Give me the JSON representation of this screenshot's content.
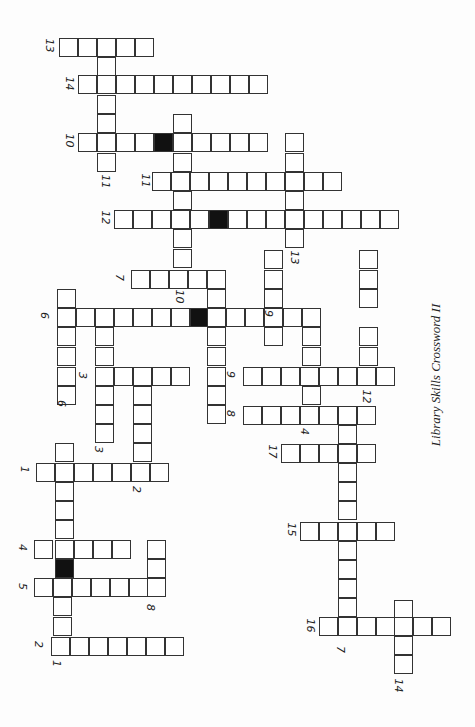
{
  "title": "Library Skills Crossword II",
  "cell_size": 19,
  "cells": [
    [
      59,
      38
    ],
    [
      78,
      38
    ],
    [
      97,
      38
    ],
    [
      116,
      38
    ],
    [
      135,
      38
    ],
    [
      97,
      57
    ],
    [
      78,
      75
    ],
    [
      97,
      75
    ],
    [
      116,
      75
    ],
    [
      135,
      75
    ],
    [
      154,
      75
    ],
    [
      173,
      75
    ],
    [
      192,
      75
    ],
    [
      211,
      75
    ],
    [
      230,
      75
    ],
    [
      249,
      75
    ],
    [
      97,
      95
    ],
    [
      97,
      114
    ],
    [
      173,
      114
    ],
    [
      78,
      133
    ],
    [
      97,
      133
    ],
    [
      116,
      133
    ],
    [
      135,
      133
    ],
    [
      154,
      133,
      "black"
    ],
    [
      173,
      133
    ],
    [
      192,
      133
    ],
    [
      211,
      133
    ],
    [
      230,
      133
    ],
    [
      249,
      133
    ],
    [
      285,
      133
    ],
    [
      285,
      153
    ],
    [
      97,
      153
    ],
    [
      173,
      153
    ],
    [
      152,
      172
    ],
    [
      171,
      172
    ],
    [
      190,
      172
    ],
    [
      209,
      172
    ],
    [
      228,
      172
    ],
    [
      247,
      172
    ],
    [
      266,
      172
    ],
    [
      285,
      172
    ],
    [
      304,
      172
    ],
    [
      323,
      172
    ],
    [
      173,
      191
    ],
    [
      285,
      191
    ],
    [
      114,
      210
    ],
    [
      133,
      210
    ],
    [
      152,
      210
    ],
    [
      171,
      210
    ],
    [
      190,
      210
    ],
    [
      209,
      210,
      "black"
    ],
    [
      228,
      210
    ],
    [
      247,
      210
    ],
    [
      266,
      210
    ],
    [
      285,
      210
    ],
    [
      304,
      210
    ],
    [
      323,
      210
    ],
    [
      342,
      210
    ],
    [
      361,
      210
    ],
    [
      380,
      210
    ],
    [
      173,
      229
    ],
    [
      285,
      229
    ],
    [
      173,
      249
    ],
    [
      264,
      250
    ],
    [
      359,
      250
    ],
    [
      131,
      270
    ],
    [
      150,
      270
    ],
    [
      169,
      270
    ],
    [
      188,
      270
    ],
    [
      207,
      270
    ],
    [
      264,
      270
    ],
    [
      359,
      270
    ],
    [
      57,
      289
    ],
    [
      207,
      289
    ],
    [
      264,
      289
    ],
    [
      359,
      289
    ],
    [
      57,
      308
    ],
    [
      76,
      308
    ],
    [
      95,
      308
    ],
    [
      114,
      308
    ],
    [
      133,
      308
    ],
    [
      152,
      308
    ],
    [
      171,
      308
    ],
    [
      190,
      308,
      "black"
    ],
    [
      207,
      308
    ],
    [
      226,
      308
    ],
    [
      245,
      308
    ],
    [
      264,
      308
    ],
    [
      283,
      308
    ],
    [
      302,
      308
    ],
    [
      57,
      327
    ],
    [
      95,
      327
    ],
    [
      207,
      327
    ],
    [
      264,
      327
    ],
    [
      302,
      327
    ],
    [
      359,
      327
    ],
    [
      57,
      347
    ],
    [
      95,
      347
    ],
    [
      207,
      347
    ],
    [
      302,
      347
    ],
    [
      359,
      347
    ],
    [
      57,
      367
    ],
    [
      95,
      367
    ],
    [
      114,
      367
    ],
    [
      133,
      367
    ],
    [
      152,
      367
    ],
    [
      171,
      367
    ],
    [
      207,
      367
    ],
    [
      243,
      367
    ],
    [
      262,
      367
    ],
    [
      281,
      367
    ],
    [
      300,
      367
    ],
    [
      319,
      367
    ],
    [
      338,
      367
    ],
    [
      357,
      367
    ],
    [
      376,
      367
    ],
    [
      57,
      386
    ],
    [
      95,
      386
    ],
    [
      133,
      386
    ],
    [
      207,
      386
    ],
    [
      302,
      386
    ],
    [
      95,
      405
    ],
    [
      133,
      405
    ],
    [
      207,
      405
    ],
    [
      243,
      406
    ],
    [
      262,
      406
    ],
    [
      281,
      406
    ],
    [
      300,
      406
    ],
    [
      319,
      406
    ],
    [
      338,
      406
    ],
    [
      357,
      406
    ],
    [
      95,
      424
    ],
    [
      133,
      424
    ],
    [
      338,
      425
    ],
    [
      55,
      443
    ],
    [
      133,
      443
    ],
    [
      281,
      444
    ],
    [
      300,
      444
    ],
    [
      319,
      444
    ],
    [
      338,
      444
    ],
    [
      357,
      444
    ],
    [
      36,
      463
    ],
    [
      55,
      463
    ],
    [
      74,
      463
    ],
    [
      93,
      463
    ],
    [
      112,
      463
    ],
    [
      131,
      463
    ],
    [
      150,
      463
    ],
    [
      338,
      463
    ],
    [
      55,
      482
    ],
    [
      338,
      482
    ],
    [
      55,
      501
    ],
    [
      338,
      501
    ],
    [
      55,
      520
    ],
    [
      300,
      522
    ],
    [
      319,
      522
    ],
    [
      338,
      522
    ],
    [
      357,
      522
    ],
    [
      376,
      522
    ],
    [
      34,
      540
    ],
    [
      55,
      540
    ],
    [
      74,
      540
    ],
    [
      93,
      540
    ],
    [
      112,
      540
    ],
    [
      147,
      540
    ],
    [
      338,
      541
    ],
    [
      55,
      559,
      "black"
    ],
    [
      147,
      559
    ],
    [
      338,
      560
    ],
    [
      34,
      578
    ],
    [
      53,
      578
    ],
    [
      72,
      578
    ],
    [
      91,
      578
    ],
    [
      110,
      578
    ],
    [
      129,
      578
    ],
    [
      147,
      578
    ],
    [
      338,
      579
    ],
    [
      53,
      597
    ],
    [
      338,
      598
    ],
    [
      394,
      600
    ],
    [
      53,
      617
    ],
    [
      319,
      617
    ],
    [
      338,
      617
    ],
    [
      357,
      617
    ],
    [
      376,
      617
    ],
    [
      394,
      617
    ],
    [
      413,
      617
    ],
    [
      432,
      617
    ],
    [
      51,
      637
    ],
    [
      70,
      637
    ],
    [
      89,
      637
    ],
    [
      108,
      637
    ],
    [
      127,
      637
    ],
    [
      146,
      637
    ],
    [
      165,
      637
    ],
    [
      394,
      636
    ],
    [
      394,
      655
    ]
  ],
  "numbers": [
    {
      "n": "13",
      "x": 48,
      "y": 46
    },
    {
      "n": "14",
      "x": 68,
      "y": 84
    },
    {
      "n": "10",
      "x": 68,
      "y": 141
    },
    {
      "n": "11",
      "x": 104,
      "y": 182
    },
    {
      "n": "11",
      "x": 144,
      "y": 181
    },
    {
      "n": "12",
      "x": 104,
      "y": 218
    },
    {
      "n": "13",
      "x": 293,
      "y": 258
    },
    {
      "n": "7",
      "x": 122,
      "y": 278
    },
    {
      "n": "10",
      "x": 178,
      "y": 297
    },
    {
      "n": "6",
      "x": 47,
      "y": 316
    },
    {
      "n": "9",
      "x": 271,
      "y": 314
    },
    {
      "n": "3",
      "x": 85,
      "y": 376
    },
    {
      "n": "9",
      "x": 233,
      "y": 375
    },
    {
      "n": "12",
      "x": 365,
      "y": 397
    },
    {
      "n": "6",
      "x": 64,
      "y": 404
    },
    {
      "n": "8",
      "x": 233,
      "y": 414
    },
    {
      "n": "4",
      "x": 307,
      "y": 432
    },
    {
      "n": "3",
      "x": 101,
      "y": 450
    },
    {
      "n": "17",
      "x": 271,
      "y": 452
    },
    {
      "n": "1",
      "x": 27,
      "y": 470
    },
    {
      "n": "2",
      "x": 139,
      "y": 490
    },
    {
      "n": "15",
      "x": 290,
      "y": 530
    },
    {
      "n": "4",
      "x": 25,
      "y": 548
    },
    {
      "n": "5",
      "x": 25,
      "y": 587
    },
    {
      "n": "8",
      "x": 153,
      "y": 608
    },
    {
      "n": "16",
      "x": 309,
      "y": 626
    },
    {
      "n": "2",
      "x": 41,
      "y": 645
    },
    {
      "n": "7",
      "x": 343,
      "y": 650
    },
    {
      "n": "1",
      "x": 59,
      "y": 664
    },
    {
      "n": "14",
      "x": 397,
      "y": 686
    }
  ]
}
